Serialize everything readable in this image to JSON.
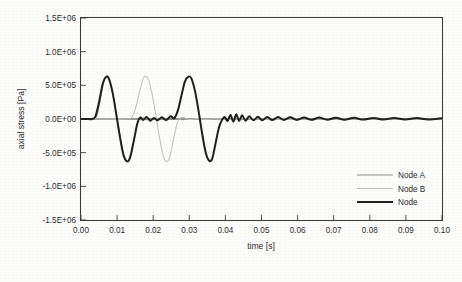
{
  "chart_data": {
    "type": "line",
    "title": "",
    "xlabel": "time [s]",
    "ylabel": "axial stress [Pa]",
    "xlim": [
      0.0,
      0.1
    ],
    "ylim": [
      -1500000,
      1500000
    ],
    "grid": false,
    "legend_position": "bottom-right",
    "xticks": [
      0.0,
      0.01,
      0.02,
      0.03,
      0.04,
      0.05,
      0.06,
      0.07,
      0.08,
      0.09,
      0.1
    ],
    "xtick_labels": [
      "0.00",
      "0.01",
      "0.02",
      "0.03",
      "0.04",
      "0.05",
      "0.06",
      "0.07",
      "0.08",
      "0.09",
      "0.10"
    ],
    "yticks": [
      1500000,
      1000000,
      500000,
      0,
      -500000,
      -1000000,
      -1500000
    ],
    "ytick_labels": [
      "1.5E+06",
      "1.0E+06",
      "5.0E+05",
      "0.0E+00",
      "-5.0E+05",
      "-1.0E+06",
      "-1.5E+06"
    ],
    "series": [
      {
        "name": "Node A",
        "color": "#8e8e8e",
        "width": 1.0,
        "points": [
          [
            0.0,
            0
          ],
          [
            0.002,
            0
          ],
          [
            0.0035,
            0
          ],
          [
            0.0045,
            60000
          ],
          [
            0.0055,
            330000
          ],
          [
            0.0065,
            580000
          ],
          [
            0.0072,
            628000
          ],
          [
            0.008,
            560000
          ],
          [
            0.009,
            320000
          ],
          [
            0.01,
            20000
          ],
          [
            0.011,
            -300000
          ],
          [
            0.012,
            -560000
          ],
          [
            0.013,
            -628000
          ],
          [
            0.0138,
            -540000
          ],
          [
            0.0148,
            -280000
          ],
          [
            0.0157,
            -40000
          ],
          [
            0.0165,
            30000
          ],
          [
            0.0175,
            10000
          ],
          [
            0.0185,
            -10000
          ],
          [
            0.02,
            5000
          ],
          [
            0.0215,
            -5000
          ],
          [
            0.0235,
            8000
          ],
          [
            0.0255,
            -6000
          ],
          [
            0.0275,
            4000
          ],
          [
            0.03,
            -4000
          ],
          [
            0.033,
            3000
          ],
          [
            0.036,
            -3000
          ],
          [
            0.04,
            2000
          ],
          [
            0.045,
            -2000
          ],
          [
            0.055,
            1500
          ],
          [
            0.07,
            -1500
          ],
          [
            0.085,
            1000
          ],
          [
            0.1,
            0
          ]
        ]
      },
      {
        "name": "Node B",
        "color": "#c2c2c2",
        "width": 1.1,
        "points": [
          [
            0.0,
            0
          ],
          [
            0.004,
            0
          ],
          [
            0.008,
            0
          ],
          [
            0.012,
            0
          ],
          [
            0.014,
            20000
          ],
          [
            0.0152,
            180000
          ],
          [
            0.0163,
            420000
          ],
          [
            0.0172,
            600000
          ],
          [
            0.018,
            635000
          ],
          [
            0.0188,
            570000
          ],
          [
            0.0198,
            340000
          ],
          [
            0.0208,
            40000
          ],
          [
            0.0218,
            -290000
          ],
          [
            0.0228,
            -550000
          ],
          [
            0.0238,
            -632000
          ],
          [
            0.0246,
            -560000
          ],
          [
            0.0256,
            -310000
          ],
          [
            0.0266,
            -70000
          ],
          [
            0.0274,
            10000
          ],
          [
            0.0285,
            20000
          ],
          [
            0.03,
            -8000
          ],
          [
            0.032,
            6000
          ],
          [
            0.0345,
            -5000
          ],
          [
            0.0375,
            4000
          ],
          [
            0.041,
            -4000
          ],
          [
            0.046,
            3000
          ],
          [
            0.055,
            -2000
          ],
          [
            0.07,
            2000
          ],
          [
            0.085,
            -1500
          ],
          [
            0.1,
            0
          ]
        ]
      },
      {
        "name": "Node",
        "color": "#1f1f1f",
        "width": 2.0,
        "points": [
          [
            0.0,
            0
          ],
          [
            0.0015,
            0
          ],
          [
            0.003,
            0
          ],
          [
            0.004,
            40000
          ],
          [
            0.005,
            250000
          ],
          [
            0.006,
            520000
          ],
          [
            0.007,
            628000
          ],
          [
            0.0078,
            590000
          ],
          [
            0.0088,
            380000
          ],
          [
            0.0098,
            60000
          ],
          [
            0.0108,
            -270000
          ],
          [
            0.0118,
            -540000
          ],
          [
            0.0128,
            -630000
          ],
          [
            0.0136,
            -570000
          ],
          [
            0.0146,
            -330000
          ],
          [
            0.0156,
            -70000
          ],
          [
            0.0164,
            20000
          ],
          [
            0.0172,
            -15000
          ],
          [
            0.0182,
            30000
          ],
          [
            0.0192,
            -25000
          ],
          [
            0.0202,
            15000
          ],
          [
            0.0212,
            -20000
          ],
          [
            0.0224,
            25000
          ],
          [
            0.0236,
            -15000
          ],
          [
            0.0248,
            40000
          ],
          [
            0.0258,
            10000
          ],
          [
            0.0268,
            120000
          ],
          [
            0.0278,
            340000
          ],
          [
            0.0288,
            560000
          ],
          [
            0.0298,
            630000
          ],
          [
            0.0306,
            600000
          ],
          [
            0.0316,
            410000
          ],
          [
            0.0326,
            110000
          ],
          [
            0.0336,
            -230000
          ],
          [
            0.0346,
            -510000
          ],
          [
            0.0356,
            -625000
          ],
          [
            0.0364,
            -580000
          ],
          [
            0.0372,
            -380000
          ],
          [
            0.0382,
            -130000
          ],
          [
            0.039,
            -20000
          ],
          [
            0.0398,
            30000
          ],
          [
            0.0406,
            -30000
          ],
          [
            0.0414,
            60000
          ],
          [
            0.0422,
            -40000
          ],
          [
            0.043,
            70000
          ],
          [
            0.0438,
            -30000
          ],
          [
            0.0446,
            55000
          ],
          [
            0.0456,
            -25000
          ],
          [
            0.0466,
            40000
          ],
          [
            0.0478,
            -20000
          ],
          [
            0.049,
            35000
          ],
          [
            0.0502,
            -18000
          ],
          [
            0.0516,
            30000
          ],
          [
            0.053,
            -16000
          ],
          [
            0.0546,
            28000
          ],
          [
            0.0562,
            -14000
          ],
          [
            0.058,
            25000
          ],
          [
            0.0598,
            -13000
          ],
          [
            0.0618,
            23000
          ],
          [
            0.0638,
            -12000
          ],
          [
            0.066,
            21000
          ],
          [
            0.0682,
            -11000
          ],
          [
            0.0706,
            19000
          ],
          [
            0.073,
            -10000
          ],
          [
            0.0756,
            18000
          ],
          [
            0.0782,
            -9000
          ],
          [
            0.081,
            16000
          ],
          [
            0.0838,
            -8000
          ],
          [
            0.0868,
            15000
          ],
          [
            0.0898,
            -8000
          ],
          [
            0.093,
            14000
          ],
          [
            0.0962,
            -7000
          ],
          [
            0.1,
            12000
          ]
        ]
      }
    ]
  },
  "legend": {
    "items": [
      {
        "label": "Node A"
      },
      {
        "label": "Node B"
      },
      {
        "label": "Node"
      }
    ]
  }
}
